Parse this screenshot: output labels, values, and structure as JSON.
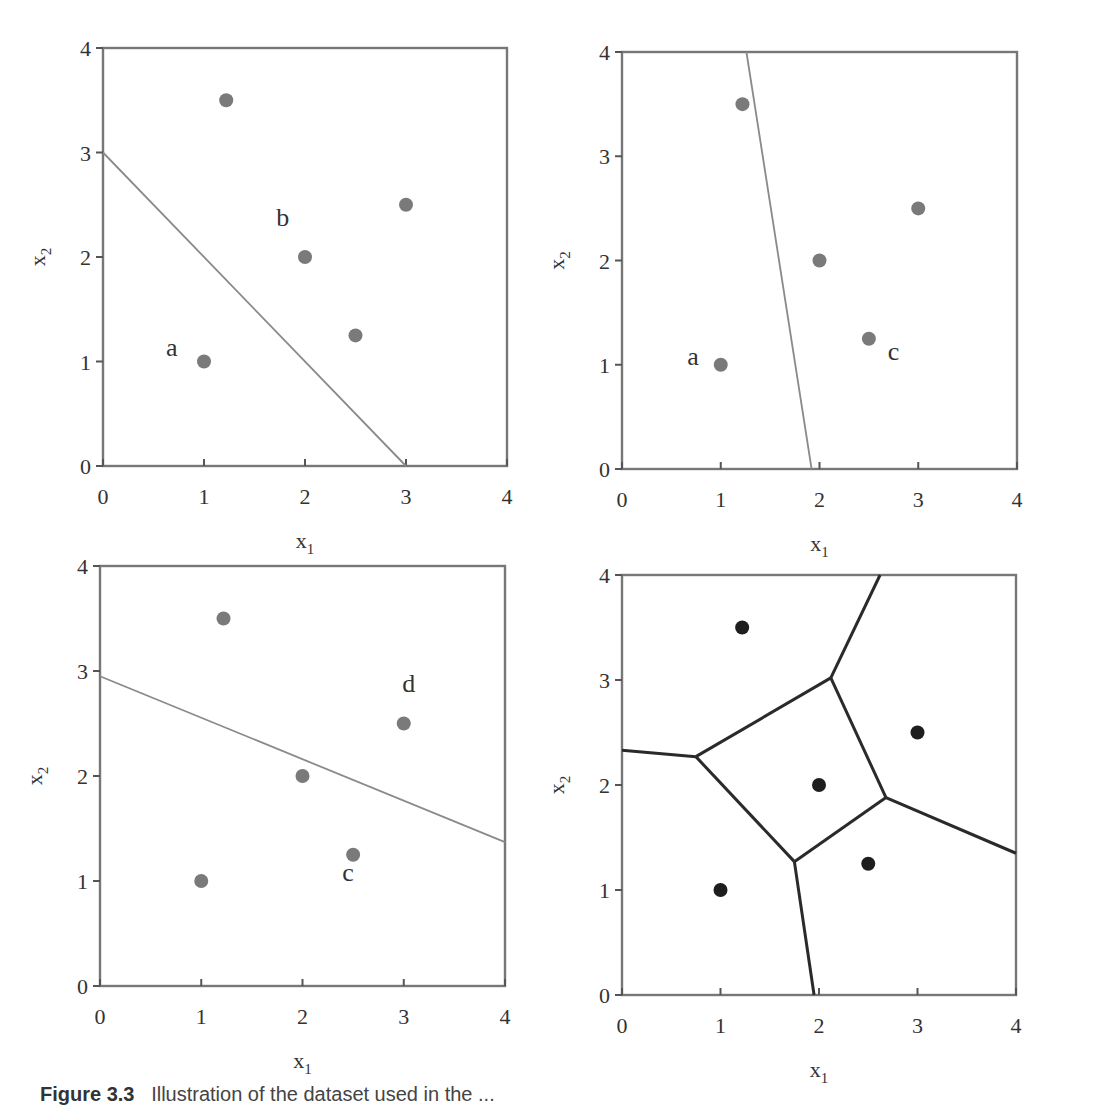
{
  "figure": {
    "caption_label": "Figure 3.3",
    "caption_text": "Illustration of the dataset used in the ...",
    "caption_note": "caption is cut off at bottom edge of image"
  },
  "chart_data": [
    {
      "type": "scatter",
      "panel": "top-left",
      "title": "",
      "xlabel": "x1",
      "ylabel": "x2",
      "xlim": [
        0,
        4
      ],
      "ylim": [
        0,
        4
      ],
      "xticks": [
        "0",
        "1",
        "2",
        "3",
        "4"
      ],
      "yticks": [
        "0",
        "1",
        "2",
        "3",
        "4"
      ],
      "grid": false,
      "points": [
        [
          1,
          1
        ],
        [
          1.22,
          3.5
        ],
        [
          2,
          2
        ],
        [
          2.5,
          1.25
        ],
        [
          3,
          2.5
        ]
      ],
      "annotations": [
        {
          "text": "a",
          "x": 0.68,
          "y": 1.05
        },
        {
          "text": "b",
          "x": 1.78,
          "y": 2.3
        }
      ],
      "lines": [
        {
          "from": [
            0,
            3.0
          ],
          "to": [
            3.0,
            0
          ],
          "style": "decision-boundary"
        }
      ]
    },
    {
      "type": "scatter",
      "panel": "top-right",
      "title": "",
      "xlabel": "x1",
      "ylabel": "x2",
      "xlim": [
        0,
        4
      ],
      "ylim": [
        0,
        4
      ],
      "xticks": [
        "0",
        "1",
        "2",
        "3",
        "4"
      ],
      "yticks": [
        "0",
        "1",
        "2",
        "3",
        "4"
      ],
      "grid": false,
      "points": [
        [
          1,
          1
        ],
        [
          1.22,
          3.5
        ],
        [
          2,
          2
        ],
        [
          2.5,
          1.25
        ],
        [
          3,
          2.5
        ]
      ],
      "annotations": [
        {
          "text": "a",
          "x": 0.72,
          "y": 1.0
        },
        {
          "text": "c",
          "x": 2.75,
          "y": 1.05
        }
      ],
      "lines": [
        {
          "from": [
            1.26,
            4.0
          ],
          "to": [
            1.92,
            0
          ],
          "style": "decision-boundary"
        }
      ]
    },
    {
      "type": "scatter",
      "panel": "bottom-left",
      "title": "",
      "xlabel": "x1",
      "ylabel": "x2",
      "xlim": [
        0,
        4
      ],
      "ylim": [
        0,
        4
      ],
      "xticks": [
        "0",
        "1",
        "2",
        "3",
        "4"
      ],
      "yticks": [
        "0",
        "1",
        "2",
        "3",
        "4"
      ],
      "grid": false,
      "points": [
        [
          1,
          1
        ],
        [
          1.22,
          3.5
        ],
        [
          2,
          2
        ],
        [
          2.5,
          1.25
        ],
        [
          3,
          2.5
        ]
      ],
      "annotations": [
        {
          "text": "d",
          "x": 3.05,
          "y": 2.8
        },
        {
          "text": "c",
          "x": 2.45,
          "y": 1.0
        }
      ],
      "lines": [
        {
          "from": [
            0,
            2.95
          ],
          "to": [
            4.0,
            1.37
          ],
          "style": "decision-boundary"
        }
      ]
    },
    {
      "type": "scatter",
      "panel": "bottom-right",
      "title": "",
      "xlabel": "x1",
      "ylabel": "x2",
      "xlim": [
        0,
        4
      ],
      "ylim": [
        0,
        4
      ],
      "xticks": [
        "0",
        "1",
        "2",
        "3",
        "4"
      ],
      "yticks": [
        "0",
        "1",
        "2",
        "3",
        "4"
      ],
      "grid": false,
      "points": [
        [
          1,
          1
        ],
        [
          1.22,
          3.5
        ],
        [
          2,
          2
        ],
        [
          2.5,
          1.25
        ],
        [
          3,
          2.5
        ]
      ],
      "annotations": [],
      "lines": [
        {
          "from": [
            0,
            2.33
          ],
          "to": [
            0.75,
            2.27
          ],
          "style": "voronoi"
        },
        {
          "from": [
            0.75,
            2.27
          ],
          "to": [
            2.12,
            3.02
          ],
          "style": "voronoi"
        },
        {
          "from": [
            2.12,
            3.02
          ],
          "to": [
            2.62,
            4.0
          ],
          "style": "voronoi"
        },
        {
          "from": [
            2.12,
            3.02
          ],
          "to": [
            2.68,
            1.88
          ],
          "style": "voronoi"
        },
        {
          "from": [
            2.68,
            1.88
          ],
          "to": [
            4.0,
            1.35
          ],
          "style": "voronoi"
        },
        {
          "from": [
            2.68,
            1.88
          ],
          "to": [
            1.75,
            1.27
          ],
          "style": "voronoi"
        },
        {
          "from": [
            1.75,
            1.27
          ],
          "to": [
            0.75,
            2.27
          ],
          "style": "voronoi"
        },
        {
          "from": [
            1.75,
            1.27
          ],
          "to": [
            1.95,
            0
          ],
          "style": "voronoi"
        }
      ]
    }
  ],
  "layout": {
    "panels": [
      {
        "x0": 103,
        "x4": 507,
        "y4": 48,
        "y0": 466,
        "point_class": "pt-grey",
        "line_class": "dec-line"
      },
      {
        "x0": 622,
        "x4": 1017,
        "y4": 52,
        "y0": 469,
        "point_class": "pt-grey",
        "line_class": "dec-line"
      },
      {
        "x0": 100,
        "x4": 505,
        "y4": 566,
        "y0": 986,
        "point_class": "pt-grey",
        "line_class": "dec-line"
      },
      {
        "x0": 622,
        "x4": 1016,
        "y4": 575,
        "y0": 995,
        "point_class": "pt-dark",
        "line_class": "vor-line"
      }
    ]
  }
}
